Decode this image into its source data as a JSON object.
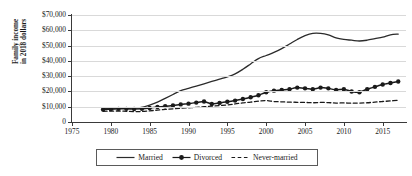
{
  "chart_data": {
    "type": "line",
    "title": "",
    "xlabel": "",
    "ylabel": "Family income in 2018 dollars",
    "ylabel_line1": "Family income",
    "ylabel_line2": "in 2018 dollars",
    "xlim": [
      1975,
      2018
    ],
    "ylim": [
      0,
      70000
    ],
    "grid": true,
    "legend_position": "bottom-center",
    "y_ticks": [
      0,
      10000,
      20000,
      30000,
      40000,
      50000,
      60000,
      70000
    ],
    "y_tick_labels": [
      "0",
      "$10,000",
      "$20,000",
      "$30,000",
      "$40,000",
      "$50,000",
      "$60,000",
      "$70,000"
    ],
    "x_ticks": [
      1975,
      1980,
      1985,
      1990,
      1995,
      2000,
      2005,
      2010,
      2015
    ],
    "x_tick_labels": [
      "1975",
      "1980",
      "1985",
      "1990",
      "1995",
      "2000",
      "2005",
      "2010",
      "2015"
    ],
    "x": [
      1979,
      1980,
      1981,
      1982,
      1983,
      1984,
      1985,
      1986,
      1987,
      1988,
      1989,
      1990,
      1991,
      1992,
      1993,
      1994,
      1995,
      1996,
      1997,
      1998,
      1999,
      2000,
      2001,
      2002,
      2003,
      2004,
      2005,
      2006,
      2007,
      2008,
      2009,
      2010,
      2011,
      2012,
      2013,
      2014,
      2015,
      2016,
      2017
    ],
    "series": [
      {
        "name": "Married",
        "style": "solid",
        "marker": "none",
        "color": "#2b2b2b",
        "values": [
          8600,
          9000,
          9100,
          9000,
          9200,
          9500,
          11000,
          13000,
          15500,
          18000,
          20500,
          22000,
          23500,
          25000,
          26500,
          28000,
          29500,
          31500,
          34500,
          38000,
          41500,
          43500,
          45500,
          48000,
          51000,
          54000,
          56500,
          58000,
          58000,
          57000,
          55000,
          54000,
          53500,
          53000,
          53500,
          54500,
          55500,
          57000,
          57500
        ]
      },
      {
        "name": "Divorced",
        "style": "solid",
        "marker": "circle",
        "color": "#1a1a1a",
        "values": [
          8200,
          8400,
          8600,
          8600,
          8500,
          8600,
          9200,
          9800,
          10300,
          10800,
          11500,
          12000,
          12700,
          13400,
          11800,
          12500,
          13200,
          14000,
          15000,
          16200,
          17500,
          19500,
          20500,
          21000,
          21500,
          22500,
          22000,
          21500,
          22500,
          22000,
          21000,
          21500,
          20000,
          19500,
          21500,
          23000,
          24500,
          25500,
          26500
        ]
      },
      {
        "name": "Never-married",
        "style": "dashed",
        "marker": "none",
        "color": "#1a1a1a",
        "values": [
          7000,
          7100,
          7200,
          7000,
          6800,
          6900,
          7300,
          7800,
          8200,
          8600,
          9000,
          9300,
          9600,
          10000,
          10400,
          10800,
          11200,
          11800,
          12500,
          13000,
          13600,
          14000,
          13400,
          13200,
          13000,
          12900,
          12800,
          12600,
          12800,
          12700,
          12400,
          12500,
          12300,
          12400,
          12600,
          13000,
          13400,
          13800,
          14200
        ]
      }
    ]
  },
  "legend": {
    "items": [
      {
        "label": "Married"
      },
      {
        "label": "Divorced"
      },
      {
        "label": "Never-married"
      }
    ]
  }
}
